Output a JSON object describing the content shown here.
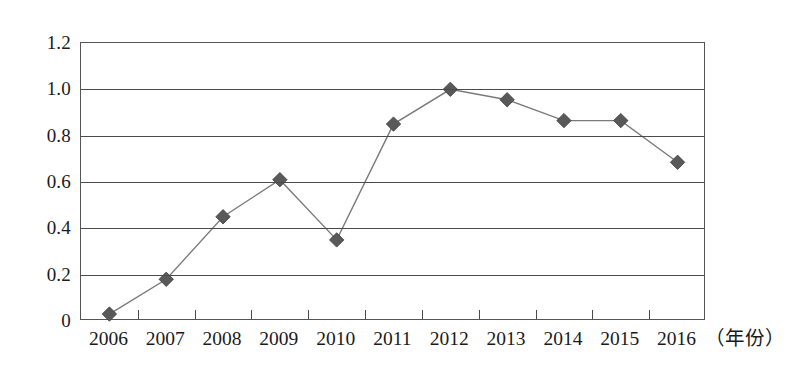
{
  "chart_data": {
    "type": "line",
    "title": "",
    "xlabel": "年份",
    "ylabel": "",
    "categories": [
      "2006",
      "2007",
      "2008",
      "2009",
      "2010",
      "2011",
      "2012",
      "2013",
      "2014",
      "2015",
      "2016"
    ],
    "values": [
      0.03,
      0.18,
      0.45,
      0.61,
      0.35,
      0.85,
      1.0,
      0.955,
      0.865,
      0.865,
      0.685
    ],
    "series": [
      {
        "name": "",
        "values": [
          0.03,
          0.18,
          0.45,
          0.61,
          0.35,
          0.85,
          1.0,
          0.955,
          0.865,
          0.865,
          0.685
        ]
      }
    ],
    "ylim": [
      0,
      1.2
    ],
    "ytick_labels": [
      "1.2",
      "1.0",
      "0.8",
      "0.6",
      "0.4",
      "0.2",
      "0"
    ],
    "ytick_values": [
      1.2,
      1.0,
      0.8,
      0.6,
      0.4,
      0.2,
      0
    ],
    "grid": "horizontal",
    "legend": "none",
    "marker": "diamond",
    "marker_color": "#595959",
    "line_color": "#7a7a7a",
    "axis_color": "#4a4a4a"
  },
  "axis": {
    "x_title_text": "（年份）"
  }
}
